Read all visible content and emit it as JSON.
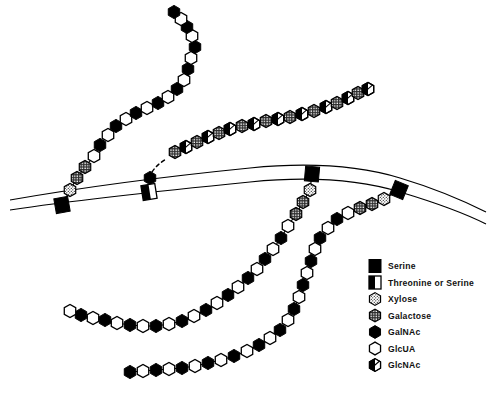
{
  "figure": {
    "background_color": "#ffffff",
    "ink_color": "#000000"
  },
  "core_protein": {
    "name": "core-protein-ribbon",
    "description": "Two parallel curved lines forming a ribbon crossing the figure horizontally",
    "top_path": "M 10,200 C 90,186 170,176 250,168 C 310,162 360,166 400,178 C 440,190 470,204 486,212",
    "bottom_path": "M 10,210 C 90,198 170,190 250,182 C 310,176 360,180 400,192 C 440,204 470,216 486,224"
  },
  "attachment_sites": [
    {
      "name": "serine-site-left",
      "symbol": "serine",
      "x": 62,
      "y": 205,
      "angle": -10
    },
    {
      "name": "threonine-site-middle",
      "symbol": "threonine_or_serine",
      "x": 149,
      "y": 192,
      "angle": -9
    },
    {
      "name": "serine-site-center-right",
      "symbol": "serine",
      "x": 312,
      "y": 174,
      "angle": 5
    },
    {
      "name": "serine-site-right",
      "symbol": "serine",
      "x": 399,
      "y": 190,
      "angle": 22
    }
  ],
  "legend": {
    "name": "symbol-legend",
    "x": 368,
    "y": 266,
    "row_height": 16.5,
    "items": [
      {
        "label": "Serine",
        "symbol": "serine",
        "shape": "square",
        "fill": "solid-black"
      },
      {
        "label": "Threonine or Serine",
        "symbol": "threonine_or_serine",
        "shape": "square",
        "fill": "half-black"
      },
      {
        "label": "Xylose",
        "symbol": "xylose",
        "shape": "hexagon",
        "fill": "stippled"
      },
      {
        "label": "Galactose",
        "symbol": "galactose",
        "shape": "hexagon",
        "fill": "cross-hatched"
      },
      {
        "label": "GalNAc",
        "symbol": "galnac",
        "shape": "hexagon",
        "fill": "solid-black"
      },
      {
        "label": "GlcUA",
        "symbol": "glcua",
        "shape": "hexagon",
        "fill": "white"
      },
      {
        "label": "GlcNAc",
        "symbol": "glcnac",
        "shape": "hexagon",
        "fill": "diagonal-half-black"
      }
    ]
  },
  "chains": [
    {
      "name": "chain-upper-left",
      "attachment": "serine-site-left",
      "description": "Chondroitin/dermatan sulfate chain rising up and left, curving to upper center",
      "residues": [
        {
          "symbol": "xylose",
          "x": 70,
          "y": 190
        },
        {
          "symbol": "galactose",
          "x": 77,
          "y": 178
        },
        {
          "symbol": "galactose",
          "x": 85,
          "y": 167
        },
        {
          "symbol": "glcua",
          "x": 94,
          "y": 156
        },
        {
          "symbol": "galnac",
          "x": 100,
          "y": 145
        },
        {
          "symbol": "glcua",
          "x": 108,
          "y": 135
        },
        {
          "symbol": "galnac",
          "x": 116,
          "y": 126
        },
        {
          "symbol": "glcua",
          "x": 126,
          "y": 119
        },
        {
          "symbol": "galnac",
          "x": 136,
          "y": 113
        },
        {
          "symbol": "glcua",
          "x": 147,
          "y": 108
        },
        {
          "symbol": "galnac",
          "x": 158,
          "y": 103
        },
        {
          "symbol": "glcua",
          "x": 168,
          "y": 97
        },
        {
          "symbol": "galnac",
          "x": 177,
          "y": 89
        },
        {
          "symbol": "glcua",
          "x": 184,
          "y": 80
        },
        {
          "symbol": "galnac",
          "x": 188,
          "y": 69
        },
        {
          "symbol": "glcua",
          "x": 191,
          "y": 58
        },
        {
          "symbol": "galnac",
          "x": 195,
          "y": 47
        },
        {
          "symbol": "glcua",
          "x": 192,
          "y": 36
        },
        {
          "symbol": "galnac",
          "x": 187,
          "y": 27
        },
        {
          "symbol": "glcua",
          "x": 181,
          "y": 19
        },
        {
          "symbol": "galnac",
          "x": 174,
          "y": 12
        }
      ]
    },
    {
      "name": "chain-middle-oligosaccharide",
      "attachment": "threonine-site-middle",
      "description": "O-linked oligosaccharide: GalNAc then dashed linker then alternating GlcNAc and Galactose extending to upper right",
      "linker_dashed": true,
      "linker_path": "M 152,172 C 156,166 160,163 166,159",
      "residues": [
        {
          "symbol": "galnac",
          "x": 150,
          "y": 178
        },
        {
          "symbol": "galactose",
          "x": 175,
          "y": 152
        },
        {
          "symbol": "glcnac",
          "x": 186,
          "y": 147
        },
        {
          "symbol": "galactose",
          "x": 197,
          "y": 142
        },
        {
          "symbol": "glcnac",
          "x": 208,
          "y": 137
        },
        {
          "symbol": "galactose",
          "x": 219,
          "y": 133
        },
        {
          "symbol": "glcnac",
          "x": 230,
          "y": 129
        },
        {
          "symbol": "galactose",
          "x": 242,
          "y": 126
        },
        {
          "symbol": "glcnac",
          "x": 254,
          "y": 124
        },
        {
          "symbol": "galactose",
          "x": 266,
          "y": 121
        },
        {
          "symbol": "glcnac",
          "x": 278,
          "y": 119
        },
        {
          "symbol": "galactose",
          "x": 290,
          "y": 117
        },
        {
          "symbol": "glcnac",
          "x": 302,
          "y": 114
        },
        {
          "symbol": "galactose",
          "x": 314,
          "y": 111
        },
        {
          "symbol": "glcnac",
          "x": 326,
          "y": 107
        },
        {
          "symbol": "galactose",
          "x": 337,
          "y": 103
        },
        {
          "symbol": "glcnac",
          "x": 348,
          "y": 98
        },
        {
          "symbol": "galactose",
          "x": 358,
          "y": 93
        },
        {
          "symbol": "glcnac",
          "x": 368,
          "y": 89
        }
      ]
    },
    {
      "name": "chain-center-descending",
      "attachment": "serine-site-center-right",
      "description": "Chondroitin sulfate chain descending from center of core protein, sweeping left along the bottom",
      "residues": [
        {
          "symbol": "xylose",
          "x": 310,
          "y": 190
        },
        {
          "symbol": "galactose",
          "x": 303,
          "y": 202
        },
        {
          "symbol": "galactose",
          "x": 296,
          "y": 214
        },
        {
          "symbol": "glcua",
          "x": 288,
          "y": 226
        },
        {
          "symbol": "galnac",
          "x": 281,
          "y": 238
        },
        {
          "symbol": "glcua",
          "x": 273,
          "y": 249
        },
        {
          "symbol": "galnac",
          "x": 265,
          "y": 259
        },
        {
          "symbol": "glcua",
          "x": 257,
          "y": 269
        },
        {
          "symbol": "galnac",
          "x": 248,
          "y": 278
        },
        {
          "symbol": "glcua",
          "x": 238,
          "y": 287
        },
        {
          "symbol": "galnac",
          "x": 228,
          "y": 295
        },
        {
          "symbol": "glcua",
          "x": 217,
          "y": 303
        },
        {
          "symbol": "galnac",
          "x": 206,
          "y": 310
        },
        {
          "symbol": "glcua",
          "x": 194,
          "y": 316
        },
        {
          "symbol": "galnac",
          "x": 182,
          "y": 321
        },
        {
          "symbol": "glcua",
          "x": 169,
          "y": 324
        },
        {
          "symbol": "galnac",
          "x": 156,
          "y": 326
        },
        {
          "symbol": "glcua",
          "x": 143,
          "y": 326
        },
        {
          "symbol": "galnac",
          "x": 130,
          "y": 325
        },
        {
          "symbol": "glcua",
          "x": 117,
          "y": 323
        },
        {
          "symbol": "galnac",
          "x": 105,
          "y": 320
        },
        {
          "symbol": "glcua",
          "x": 93,
          "y": 318
        },
        {
          "symbol": "galnac",
          "x": 81,
          "y": 315
        },
        {
          "symbol": "glcua",
          "x": 70,
          "y": 311
        }
      ]
    },
    {
      "name": "chain-right-descending",
      "attachment": "serine-site-right",
      "description": "Chondroitin sulfate chain descending from right attachment site, sweeping left along the lowest part of the figure",
      "residues": [
        {
          "symbol": "xylose",
          "x": 384,
          "y": 199
        },
        {
          "symbol": "galactose",
          "x": 372,
          "y": 204
        },
        {
          "symbol": "galactose",
          "x": 360,
          "y": 208
        },
        {
          "symbol": "glcua",
          "x": 348,
          "y": 213
        },
        {
          "symbol": "galnac",
          "x": 337,
          "y": 219
        },
        {
          "symbol": "glcua",
          "x": 328,
          "y": 228
        },
        {
          "symbol": "galnac",
          "x": 320,
          "y": 238
        },
        {
          "symbol": "glcua",
          "x": 315,
          "y": 249
        },
        {
          "symbol": "galnac",
          "x": 311,
          "y": 261
        },
        {
          "symbol": "glcua",
          "x": 307,
          "y": 273
        },
        {
          "symbol": "galnac",
          "x": 303,
          "y": 285
        },
        {
          "symbol": "glcua",
          "x": 299,
          "y": 297
        },
        {
          "symbol": "galnac",
          "x": 294,
          "y": 309
        },
        {
          "symbol": "glcua",
          "x": 288,
          "y": 320
        },
        {
          "symbol": "galnac",
          "x": 280,
          "y": 330
        },
        {
          "symbol": "glcua",
          "x": 270,
          "y": 338
        },
        {
          "symbol": "galnac",
          "x": 259,
          "y": 345
        },
        {
          "symbol": "glcua",
          "x": 247,
          "y": 351
        },
        {
          "symbol": "galnac",
          "x": 234,
          "y": 356
        },
        {
          "symbol": "glcua",
          "x": 221,
          "y": 360
        },
        {
          "symbol": "galnac",
          "x": 208,
          "y": 363
        },
        {
          "symbol": "glcua",
          "x": 195,
          "y": 366
        },
        {
          "symbol": "galnac",
          "x": 182,
          "y": 368
        },
        {
          "symbol": "glcua",
          "x": 169,
          "y": 369
        },
        {
          "symbol": "galnac",
          "x": 156,
          "y": 370
        },
        {
          "symbol": "glcua",
          "x": 143,
          "y": 371
        },
        {
          "symbol": "galnac",
          "x": 130,
          "y": 372
        }
      ]
    }
  ]
}
